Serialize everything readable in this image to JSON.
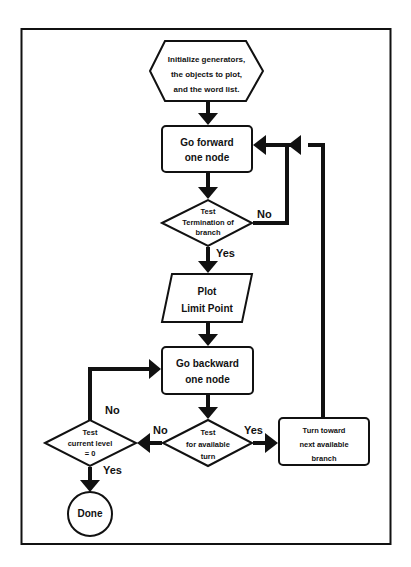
{
  "diagram": {
    "type": "flowchart",
    "colors": {
      "stroke": "#111111",
      "fill": "#ffffff",
      "background": "#ffffff"
    },
    "nodes": {
      "init": {
        "shape": "hexagon",
        "lines": [
          "Initialize generators,",
          "the objects to plot,",
          "and the word list."
        ]
      },
      "forward": {
        "shape": "rounded-rect",
        "lines": [
          "Go forward",
          "one node"
        ]
      },
      "test_term": {
        "shape": "diamond",
        "lines": [
          "Test",
          "Termination of",
          "branch"
        ]
      },
      "plot": {
        "shape": "parallelogram",
        "lines": [
          "Plot",
          "Limit Point"
        ]
      },
      "backward": {
        "shape": "rounded-rect",
        "lines": [
          "Go backward",
          "one node"
        ]
      },
      "test_turn": {
        "shape": "diamond",
        "lines": [
          "Test",
          "for available",
          "turn"
        ]
      },
      "test_level": {
        "shape": "diamond",
        "lines": [
          "Test",
          "current level",
          "= 0"
        ]
      },
      "turn": {
        "shape": "rounded-rect",
        "lines": [
          "Turn toward",
          "next available",
          "branch"
        ]
      },
      "done": {
        "shape": "circle",
        "lines": [
          "Done"
        ]
      }
    },
    "edges": {
      "term_no": "No",
      "term_yes": "Yes",
      "turn_no": "No",
      "turn_yes": "Yes",
      "level_no": "No",
      "level_yes": "Yes"
    }
  }
}
